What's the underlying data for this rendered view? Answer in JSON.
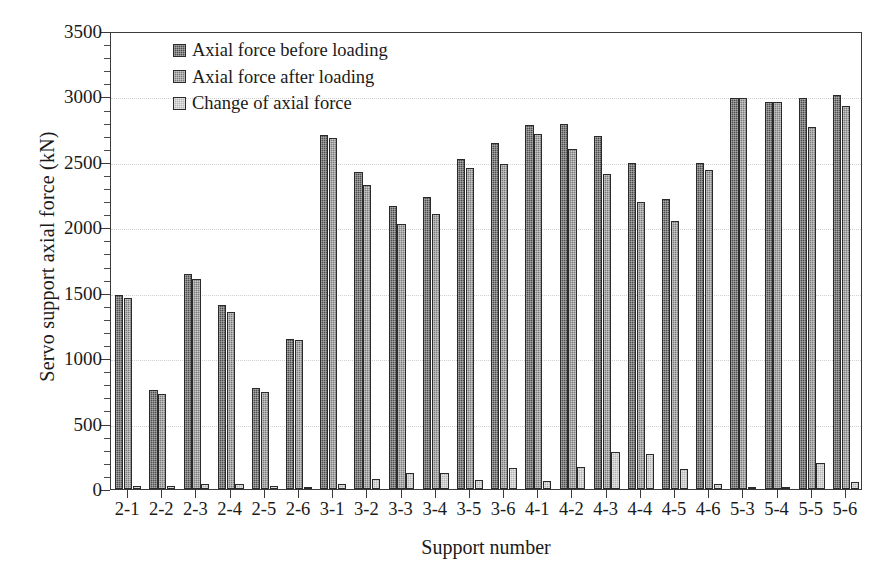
{
  "chart_data": {
    "type": "bar",
    "title": "",
    "xlabel": "Support number",
    "ylabel": "Servo support axial force (kN)",
    "ylim": [
      0,
      3500
    ],
    "ytick_step": 500,
    "yticks": [
      0,
      500,
      1000,
      1500,
      2000,
      2500,
      3000,
      3500
    ],
    "ytick_labels": [
      "0",
      "500",
      "1000",
      "1500",
      "2000",
      "2500",
      "3000",
      "3500"
    ],
    "minor_ticks_per_interval": 5,
    "grid": true,
    "grid_axis": "y",
    "legend_position": "upper-left-inside",
    "categories": [
      "2-1",
      "2-2",
      "2-3",
      "2-4",
      "2-5",
      "2-6",
      "3-1",
      "3-2",
      "3-3",
      "3-4",
      "3-5",
      "3-6",
      "4-1",
      "4-2",
      "4-3",
      "4-4",
      "4-5",
      "4-6",
      "5-3",
      "5-4",
      "5-5",
      "5-6"
    ],
    "series": [
      {
        "name": "Axial force before loading",
        "color": "#4d4d4d",
        "values": [
          1480,
          755,
          1640,
          1405,
          775,
          1150,
          2705,
          2420,
          2160,
          2235,
          2520,
          2645,
          2785,
          2790,
          2700,
          2490,
          2220,
          2495,
          2985,
          2960,
          2990,
          3010
        ]
      },
      {
        "name": "Axial force after loading",
        "color": "#7d7d7d",
        "values": [
          1460,
          725,
          1605,
          1355,
          740,
          1135,
          2680,
          2325,
          2025,
          2105,
          2450,
          2480,
          2715,
          2600,
          2410,
          2195,
          2045,
          2440,
          2985,
          2955,
          2770,
          2925
        ]
      },
      {
        "name": "Change of axial force",
        "color": "#b4b4b4",
        "values": [
          20,
          25,
          35,
          40,
          25,
          15,
          35,
          75,
          120,
          120,
          70,
          160,
          60,
          165,
          280,
          265,
          150,
          40,
          5,
          5,
          195,
          55
        ]
      }
    ]
  }
}
